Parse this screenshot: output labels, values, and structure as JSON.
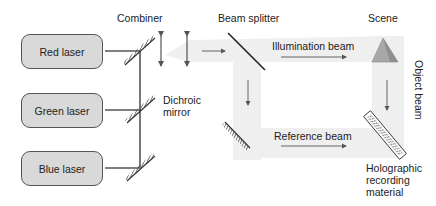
{
  "lasers": [
    {
      "label": "Red laser"
    },
    {
      "label": "Green laser"
    },
    {
      "label": "Blue laser"
    }
  ],
  "labels": {
    "combiner": "Combiner",
    "beam_splitter": "Beam splitter",
    "scene": "Scene",
    "illumination_beam": "Illumination beam",
    "reference_beam": "Reference beam",
    "object_beam": "Object beam",
    "dichroic_line1": "Dichroic",
    "dichroic_line2": "mirror",
    "holo_line1": "Holographic",
    "holo_line2": "recording",
    "holo_line3": "material"
  },
  "colors": {
    "beam_band": "#efefef",
    "laser_fill": "#d9d9d9",
    "line": "#555555",
    "scene": "#a8a8a8"
  }
}
